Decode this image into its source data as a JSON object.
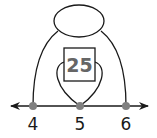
{
  "diagram": {
    "type": "number-line-arcs",
    "box_value": "25",
    "top_oval_value": "",
    "number_line": {
      "labels": [
        "4",
        "5",
        "6"
      ],
      "points_color": "#808080",
      "line_color": "#1a1a1a"
    },
    "colors": {
      "stroke": "#1a1a1a",
      "box_text": "#666666"
    }
  }
}
